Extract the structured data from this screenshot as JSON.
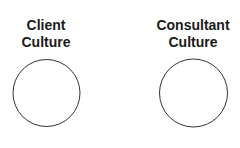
{
  "diagram": {
    "nodes": [
      {
        "id": "client",
        "label_line1": "Client",
        "label_line2": "Culture",
        "shape": "circle"
      },
      {
        "id": "consultant",
        "label_line1": "Consultant",
        "label_line2": "Culture",
        "shape": "circle"
      }
    ],
    "colors": {
      "stroke": "#333333",
      "text": "#1a1a1a",
      "background": "#ffffff"
    }
  }
}
